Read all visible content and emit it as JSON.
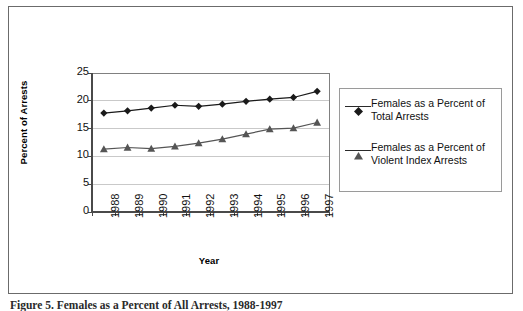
{
  "figure": {
    "caption": "Figure 5.  Females as a Percent of All Arrests, 1988-1997",
    "frame_color": "#6b6b6b",
    "background": "#ffffff"
  },
  "legend": {
    "position": "right",
    "border_color": "#9a9a9a",
    "entries": [
      {
        "label": "Females as a Percent of Total Arrests",
        "marker": "diamond-marker-icon",
        "color": "#1a1a1a"
      },
      {
        "label": "Females as a Percent of Violent Index Arrests",
        "marker": "triangle-marker-icon",
        "color": "#555555"
      }
    ]
  },
  "chart_data": {
    "type": "line",
    "title": "",
    "xlabel": "Year",
    "ylabel": "Percent of Arrests",
    "categories": [
      "1988",
      "1989",
      "1990",
      "1991",
      "1992",
      "1993",
      "1994",
      "1995",
      "1996",
      "1997"
    ],
    "ylim": [
      0,
      25
    ],
    "yticks": [
      0,
      5,
      10,
      15,
      20,
      25
    ],
    "grid": true,
    "grid_axis": "y",
    "legend_position": "right",
    "series": [
      {
        "name": "Females as a Percent of Total Arrests",
        "marker": "diamond",
        "color": "#1a1a1a",
        "values": [
          17.8,
          18.2,
          18.7,
          19.2,
          19.0,
          19.4,
          19.9,
          20.3,
          20.6,
          21.7
        ]
      },
      {
        "name": "Females as a Percent of Violent Index Arrests",
        "marker": "triangle",
        "color": "#555555",
        "values": [
          11.3,
          11.6,
          11.4,
          11.8,
          12.4,
          13.1,
          14.0,
          14.9,
          15.1,
          16.1
        ]
      }
    ]
  }
}
